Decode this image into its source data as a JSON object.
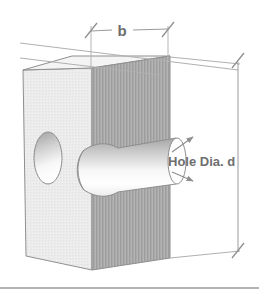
{
  "figure": {
    "kind": "engineering-isometric-diagram",
    "background_color": "#ffffff"
  },
  "labels": {
    "width_dimension": "b",
    "hole_label": "Hole Dia. d"
  },
  "colors": {
    "outline": "#8a8a8a",
    "dimension_line": "#9a9a9a",
    "text": "#6e6e6e",
    "left_face": "#e9e9e9",
    "front_face": "#a9a9a9",
    "top_face": "#f2f2f2",
    "hole_cylinder_light": "#ffffff",
    "hole_cylinder_dark": "#b4b4b4",
    "rule": "#9b9b9b"
  },
  "parts": [
    {
      "name": "left-face",
      "description": "light gray side face of block"
    },
    {
      "name": "front-face",
      "description": "medium gray hatched front slab face"
    },
    {
      "name": "top-face",
      "description": "narrow light top surface of slab"
    },
    {
      "name": "hole-entry-ellipse",
      "description": "hole opening on left face"
    },
    {
      "name": "hole-cylinder",
      "description": "cylindrical bore passing through slab"
    }
  ],
  "annotations": {
    "width": {
      "name": "b",
      "orientation": "horizontal",
      "position": "top",
      "tick_style": "slash"
    },
    "height": {
      "orientation": "vertical",
      "position": "right",
      "tick_style": "slash",
      "value": ""
    },
    "hole": {
      "name": "Hole Dia. d",
      "leader_arrows": 2,
      "arrow_style": "arrowhead"
    }
  }
}
